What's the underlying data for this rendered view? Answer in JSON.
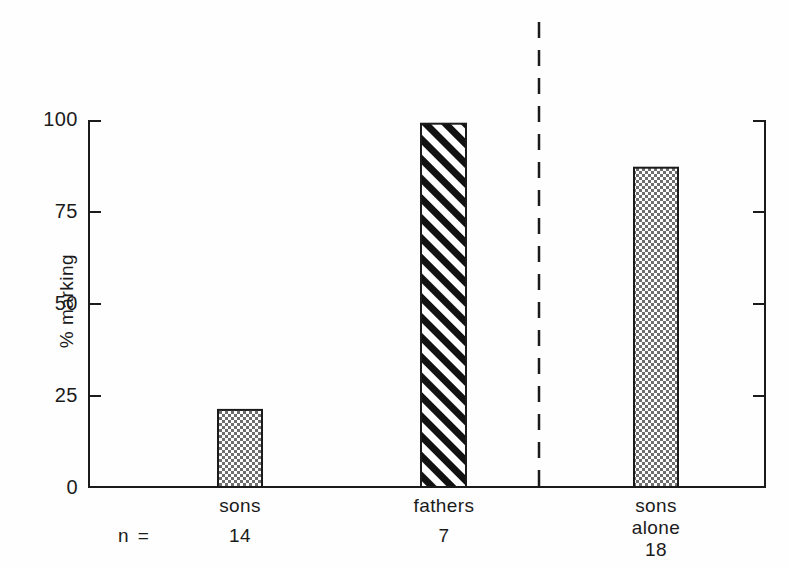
{
  "chart_data": {
    "type": "bar",
    "title": "",
    "xlabel": "",
    "ylabel": "% marking",
    "ylim": [
      0,
      100
    ],
    "yticks": [
      0,
      25,
      50,
      75,
      100
    ],
    "ytick_labels": [
      "0",
      "25",
      "50",
      "75",
      "100"
    ],
    "grid": false,
    "legend": "none",
    "categories": [
      "sons",
      "fathers",
      "sons alone"
    ],
    "values": [
      21,
      99,
      87
    ],
    "n_label": "n =",
    "n_values": [
      14,
      7,
      18
    ],
    "fills": [
      "checkered",
      "diagonal-hatch",
      "checkered"
    ],
    "annotations": [
      {
        "name": "group-divider",
        "type": "dashed-vertical-line",
        "between": [
          "fathers",
          "sons alone"
        ]
      }
    ],
    "axis_color": "#1b1b1b",
    "bar_edge_color": "#1b1b1b",
    "hatch_color": "#111111",
    "background": "#fefefe"
  },
  "labels": {
    "ytick_100": "100",
    "ytick_75": "75",
    "ytick_50": "50",
    "ytick_25": "25",
    "ytick_0": "0",
    "ylabel": "% marking",
    "cat_sons": "sons",
    "cat_fathers": "fathers",
    "cat_sons_alone_line1": "sons",
    "cat_sons_alone_line2": "alone",
    "n_equals": "n =",
    "n_sons": "14",
    "n_fathers": "7",
    "n_sons_alone": "18"
  }
}
